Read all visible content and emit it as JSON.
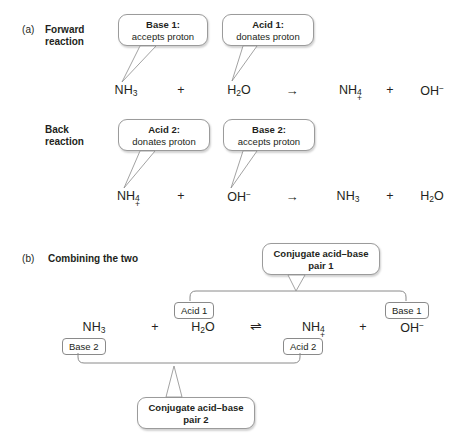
{
  "figure": {
    "background": "#ffffff",
    "line_color": "#8a8a8a",
    "text_color": "#231f20"
  },
  "panel_a": {
    "letter": "(a)",
    "title_line1": "Forward",
    "title_line2": "reaction",
    "callouts": [
      {
        "title": "Base 1:",
        "subtitle": "accepts proton"
      },
      {
        "title": "Acid 1:",
        "subtitle": "donates proton"
      }
    ],
    "equation": {
      "reactant1": "NH",
      "reactant1_sub": "3",
      "plus1": "+",
      "reactant2": "H",
      "reactant2_sub": "2",
      "reactant2_tail": "O",
      "arrow": "→",
      "product1": "NH",
      "product1_sub": "4",
      "product1_charge": "+",
      "plus2": "+",
      "product2": "OH",
      "product2_charge": "−"
    },
    "back": {
      "title_line1": "Back",
      "title_line2": "reaction",
      "callouts": [
        {
          "title": "Acid 2:",
          "subtitle": "donates proton"
        },
        {
          "title": "Base 2:",
          "subtitle": "accepts proton"
        }
      ],
      "equation": {
        "reactant1": "NH",
        "reactant1_sub": "4",
        "reactant1_charge": "+",
        "plus1": "+",
        "reactant2": "OH",
        "reactant2_charge": "−",
        "arrow": "→",
        "product1": "NH",
        "product1_sub": "3",
        "plus2": "+",
        "product2": "H",
        "product2_sub": "2",
        "product2_tail": "O"
      }
    }
  },
  "panel_b": {
    "letter": "(b)",
    "title": "Combining the two",
    "equation": {
      "reactant1": "NH",
      "reactant1_sub": "3",
      "plus1": "+",
      "reactant2": "H",
      "reactant2_sub": "2",
      "reactant2_tail": "O",
      "arrow": "⇌",
      "product1": "NH",
      "product1_sub": "4",
      "product1_charge": "+",
      "plus2": "+",
      "product2": "OH",
      "product2_charge": "−"
    },
    "tags": {
      "acid1": "Acid 1",
      "base1": "Base 1",
      "base2": "Base 2",
      "acid2": "Acid 2"
    },
    "callouts": [
      {
        "line1": "Conjugate acid–base",
        "line2": "pair 1"
      },
      {
        "line1": "Conjugate acid–base",
        "line2": "pair 2"
      }
    ]
  }
}
